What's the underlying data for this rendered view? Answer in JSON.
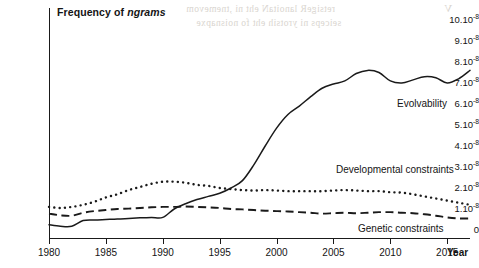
{
  "chart_data": {
    "type": "line",
    "title": "Frequency of ngrams",
    "title_plain": "Frequency of ",
    "title_italic": "ngrams",
    "xlabel": "Year",
    "ylabel": "",
    "grid": false,
    "legend_position": "inline-annotations",
    "xlim": [
      1980,
      2017
    ],
    "ylim": [
      0,
      10
    ],
    "y_unit": "1e-8",
    "x_ticks": [
      1980,
      1985,
      1990,
      1995,
      2000,
      2005,
      2010,
      2015
    ],
    "x_tick_labels": [
      "1980",
      "1985",
      "1990",
      "1995",
      "2000",
      "2005",
      "2010",
      "2015"
    ],
    "y_ticks": [
      0,
      1,
      2,
      3,
      4,
      5,
      6,
      7,
      8,
      9,
      10
    ],
    "y_tick_labels": [
      {
        "mantissa": "0",
        "exp": ""
      },
      {
        "mantissa": "1.10",
        "exp": "-8"
      },
      {
        "mantissa": "2.10",
        "exp": "-8"
      },
      {
        "mantissa": "3.10",
        "exp": "-8"
      },
      {
        "mantissa": "4.10",
        "exp": "-8"
      },
      {
        "mantissa": "5.10",
        "exp": "-8"
      },
      {
        "mantissa": "6.10",
        "exp": "-8"
      },
      {
        "mantissa": "7.10",
        "exp": "-8"
      },
      {
        "mantissa": "8.10",
        "exp": "-8"
      },
      {
        "mantissa": "9.10",
        "exp": "-8"
      },
      {
        "mantissa": "10.10",
        "exp": "-8"
      }
    ],
    "x": [
      1980,
      1981,
      1982,
      1983,
      1984,
      1985,
      1986,
      1987,
      1988,
      1989,
      1990,
      1991,
      1992,
      1993,
      1994,
      1995,
      1996,
      1997,
      1998,
      1999,
      2000,
      2001,
      2002,
      2003,
      2004,
      2005,
      2006,
      2007,
      2008,
      2009,
      2010,
      2011,
      2012,
      2013,
      2014,
      2015,
      2016,
      2017
    ],
    "series": [
      {
        "name": "Evolvability",
        "style": "solid",
        "label": "Evolvability",
        "values": [
          0.25,
          0.18,
          0.18,
          0.45,
          0.48,
          0.5,
          0.52,
          0.55,
          0.58,
          0.6,
          0.6,
          1.0,
          1.25,
          1.45,
          1.6,
          1.75,
          2.0,
          2.35,
          3.1,
          4.0,
          4.85,
          5.5,
          5.9,
          6.35,
          6.75,
          6.95,
          7.1,
          7.45,
          7.6,
          7.5,
          7.1,
          7.0,
          7.15,
          7.3,
          7.25,
          7.0,
          7.2,
          7.6
        ]
      },
      {
        "name": "Developmental constraints",
        "style": "dotted",
        "label": "Developmental constraints",
        "values": [
          1.1,
          1.05,
          1.1,
          1.2,
          1.35,
          1.55,
          1.7,
          1.9,
          2.05,
          2.2,
          2.3,
          2.3,
          2.25,
          2.15,
          2.1,
          2.0,
          1.95,
          1.9,
          1.88,
          1.9,
          1.88,
          1.85,
          1.85,
          1.85,
          1.85,
          1.88,
          1.9,
          1.88,
          1.85,
          1.85,
          1.8,
          1.78,
          1.7,
          1.6,
          1.5,
          1.4,
          1.3,
          1.2
        ]
      },
      {
        "name": "Genetic constraints",
        "style": "dashed",
        "label": "Genetic constraints",
        "values": [
          0.78,
          0.7,
          0.68,
          0.82,
          0.9,
          0.95,
          1.0,
          1.02,
          1.05,
          1.08,
          1.1,
          1.1,
          1.12,
          1.1,
          1.08,
          1.05,
          1.0,
          0.98,
          0.95,
          0.92,
          0.9,
          0.88,
          0.85,
          0.82,
          0.78,
          0.8,
          0.82,
          0.8,
          0.82,
          0.85,
          0.85,
          0.82,
          0.8,
          0.75,
          0.68,
          0.6,
          0.55,
          0.55
        ]
      }
    ]
  },
  "bleed_text": {
    "line1": "retsigeR lanoitaN eht ni ,tnemevom",
    "line2": "seiceps ni yrotsih eht fo noisnapxe",
    "corner": "V"
  }
}
